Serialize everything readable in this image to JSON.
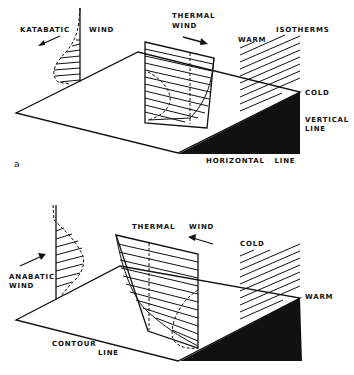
{
  "panels": [
    {
      "id": "a",
      "panel_label": "a",
      "labels": {
        "slope_wind": "KATABATIC",
        "slope_wind_2": "WIND",
        "thermal_wind_1": "THERMAL",
        "thermal_wind_2": "WIND",
        "isotherms": "ISOTHERMS",
        "upper_temp": "WARM",
        "lower_temp": "COLD",
        "vertical_line_1": "VERTICAL",
        "vertical_line_2": "LINE",
        "horizontal_line": "HORIZONTAL   LINE"
      }
    },
    {
      "id": "b",
      "labels": {
        "slope_wind_1": "ANABATIC",
        "slope_wind_2": "WIND",
        "thermal_wind_1": "THERMAL",
        "thermal_wind_2": "WIND",
        "upper_temp": "COLD",
        "lower_temp": "WARM",
        "contour_line_1": "CONTOUR",
        "contour_line_2": "LINE"
      }
    }
  ]
}
